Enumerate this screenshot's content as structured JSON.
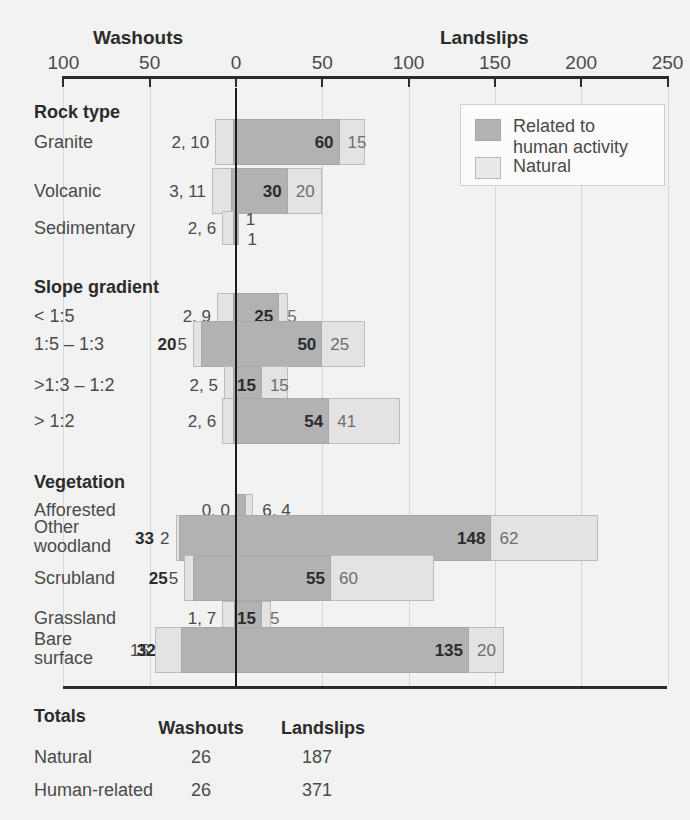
{
  "axis": {
    "left_title": "Washouts",
    "right_title": "Landslips",
    "ticks": [
      {
        "label": "100",
        "value": -100
      },
      {
        "label": "50",
        "value": -50
      },
      {
        "label": "0",
        "value": 0
      },
      {
        "label": "50",
        "value": 50
      },
      {
        "label": "100",
        "value": 100
      },
      {
        "label": "150",
        "value": 150
      },
      {
        "label": "200",
        "value": 200
      },
      {
        "label": "250",
        "value": 250
      }
    ]
  },
  "legend": {
    "items": [
      {
        "label": "Related to\nhuman activity",
        "line1": "Related to",
        "line2": "human activity",
        "color": "#b2b2b2",
        "key": "human"
      },
      {
        "label": "Natural",
        "line1": "Natural",
        "line2": "",
        "color": "#e9e9e9",
        "key": "natural"
      }
    ]
  },
  "sections": [
    {
      "title": "Rock type",
      "rows": [
        {
          "label": "Granite",
          "label2": "",
          "left_label": "2, 10",
          "human_left": 2,
          "natural_left": 10,
          "human_right": 60,
          "natural_right": 15,
          "right_dark": "60",
          "right_light": "15",
          "right_style": "inline"
        },
        {
          "label": "Volcanic",
          "label2": "",
          "left_label": "3, 11",
          "human_left": 3,
          "natural_left": 11,
          "human_right": 30,
          "natural_right": 20,
          "right_dark": "30",
          "right_light": "20",
          "right_style": "inline"
        },
        {
          "label": "Sedimentary",
          "label2": "",
          "left_label": "2, 6",
          "human_left": 2,
          "natural_left": 6,
          "human_right": 1,
          "natural_right": 1,
          "right_dark": "1",
          "right_light": "1",
          "right_style": "stacked"
        }
      ]
    },
    {
      "title": "Slope gradient",
      "rows": [
        {
          "label": "< 1:5",
          "label2": "",
          "left_label": "2, 9",
          "human_left": 2,
          "natural_left": 9,
          "human_right": 25,
          "natural_right": 5,
          "right_dark": "25",
          "right_light": "5",
          "right_style": "inline"
        },
        {
          "label": "1:5 – 1:3",
          "label2": "",
          "left_label": "5",
          "left_label2": "20",
          "human_left": 20,
          "natural_left": 5,
          "human_right": 50,
          "natural_right": 25,
          "right_dark": "50",
          "right_light": "25",
          "right_style": "inline",
          "left_style": "split"
        },
        {
          "label": ">1:3 – 1:2",
          "label2": "",
          "left_label": "2, 5",
          "human_left": 2,
          "natural_left": 5,
          "human_right": 15,
          "natural_right": 15,
          "right_dark": "15",
          "right_light": "15",
          "right_style": "inline"
        },
        {
          "label": "> 1:2",
          "label2": "",
          "left_label": "2, 6",
          "human_left": 2,
          "natural_left": 6,
          "human_right": 54,
          "natural_right": 41,
          "right_dark": "54",
          "right_light": "41",
          "right_style": "inline"
        }
      ]
    },
    {
      "title": "Vegetation",
      "rows": [
        {
          "label": "Afforested",
          "label2": "",
          "left_label": "0, 0",
          "human_left": 0,
          "natural_left": 0,
          "human_right": 6,
          "natural_right": 4,
          "right_dark": "6, 4",
          "right_light": "",
          "right_style": "combined"
        },
        {
          "label": "Other",
          "label2": "woodland",
          "left_label": "2",
          "left_label2": "33",
          "human_left": 33,
          "natural_left": 2,
          "human_right": 148,
          "natural_right": 62,
          "right_dark": "148",
          "right_light": "62",
          "right_style": "inline",
          "left_style": "split"
        },
        {
          "label": "Scrubland",
          "label2": "",
          "left_label": "5",
          "left_label2": "25",
          "human_left": 25,
          "natural_left": 5,
          "human_right": 55,
          "natural_right": 60,
          "right_dark": "55",
          "right_light": "60",
          "right_style": "inline",
          "left_style": "split"
        },
        {
          "label": "Grassland",
          "label2": "",
          "left_label": "1, 7",
          "human_left": 1,
          "natural_left": 7,
          "human_right": 15,
          "natural_right": 5,
          "right_dark": "15",
          "right_light": "5",
          "right_style": "inline"
        },
        {
          "label": "Bare",
          "label2": "surface",
          "left_label": "15",
          "left_label2": "32",
          "human_left": 32,
          "natural_left": 15,
          "human_right": 135,
          "natural_right": 20,
          "right_dark": "135",
          "right_light": "20",
          "right_style": "inline",
          "left_style": "split"
        }
      ]
    }
  ],
  "totals": {
    "title": "Totals",
    "col_headers": [
      "Washouts",
      "Landslips"
    ],
    "rows": [
      {
        "label": "Natural",
        "washouts": "26",
        "landslips": "187"
      },
      {
        "label": "Human-related",
        "washouts": "26",
        "landslips": "371"
      }
    ]
  },
  "chart_data": {
    "type": "bar",
    "orientation": "horizontal",
    "stacked": true,
    "diverging": true,
    "xlabel_left": "Washouts",
    "xlabel_right": "Landslips",
    "xlim": [
      -100,
      250
    ],
    "xticks": [
      -100,
      -50,
      0,
      50,
      100,
      150,
      200,
      250
    ],
    "xticklabels": [
      "100",
      "50",
      "0",
      "50",
      "100",
      "150",
      "200",
      "250"
    ],
    "grid": true,
    "legend": [
      "Related to human activity",
      "Natural"
    ],
    "legend_position": "top-right",
    "series": [
      {
        "name": "Washouts – Related to human activity",
        "side": "left",
        "values": [
          2,
          3,
          2,
          2,
          20,
          2,
          2,
          0,
          33,
          25,
          1,
          32
        ]
      },
      {
        "name": "Washouts – Natural",
        "side": "left",
        "values": [
          10,
          11,
          6,
          9,
          5,
          5,
          6,
          0,
          2,
          5,
          7,
          15
        ]
      },
      {
        "name": "Landslips – Related to human activity",
        "side": "right",
        "values": [
          60,
          30,
          1,
          25,
          50,
          15,
          54,
          6,
          148,
          55,
          15,
          135
        ]
      },
      {
        "name": "Landslips – Natural",
        "side": "right",
        "values": [
          15,
          20,
          1,
          5,
          25,
          15,
          41,
          4,
          62,
          60,
          5,
          20
        ]
      }
    ],
    "categories": [
      "Granite",
      "Volcanic",
      "Sedimentary",
      "< 1:5",
      "1:5 – 1:3",
      ">1:3 – 1:2",
      "> 1:2",
      "Afforested",
      "Other woodland",
      "Scrubland",
      "Grassland",
      "Bare surface"
    ],
    "category_groups": [
      {
        "name": "Rock type",
        "categories": [
          "Granite",
          "Volcanic",
          "Sedimentary"
        ]
      },
      {
        "name": "Slope gradient",
        "categories": [
          "< 1:5",
          "1:5 – 1:3",
          ">1:3 – 1:2",
          "> 1:2"
        ]
      },
      {
        "name": "Vegetation",
        "categories": [
          "Afforested",
          "Other woodland",
          "Scrubland",
          "Grassland",
          "Bare surface"
        ]
      }
    ],
    "totals_table": {
      "columns": [
        "",
        "Washouts",
        "Landslips"
      ],
      "rows": [
        [
          "Natural",
          "26",
          "187"
        ],
        [
          "Human-related",
          "26",
          "371"
        ]
      ]
    }
  }
}
